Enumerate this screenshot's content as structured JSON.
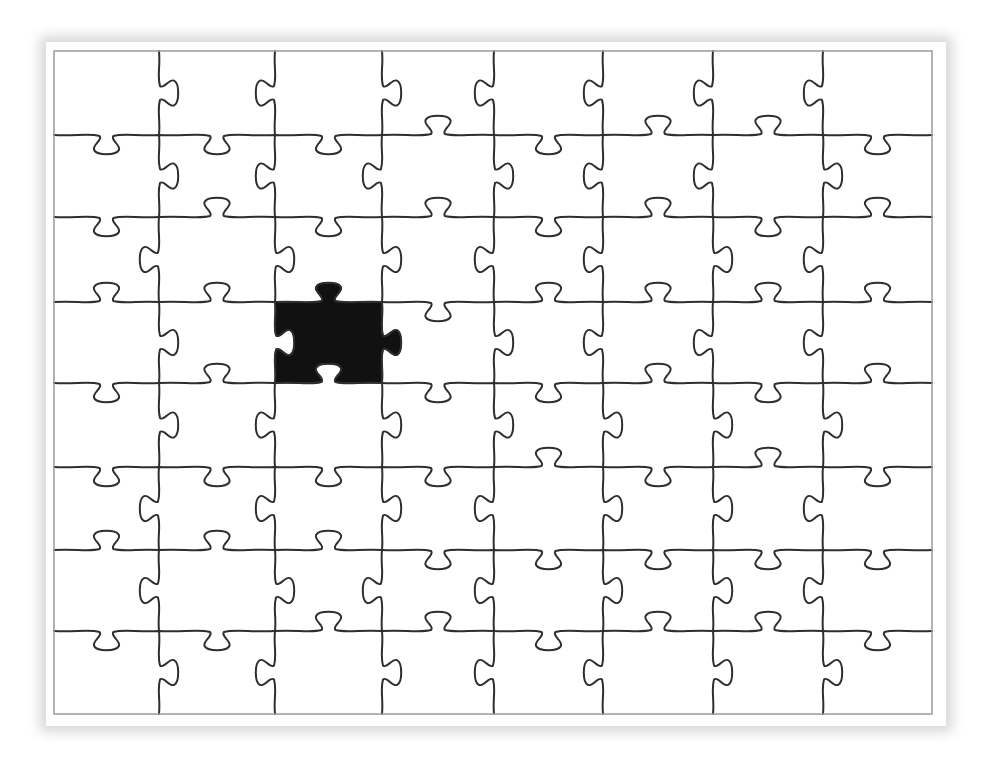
{
  "puzzle": {
    "title": "Jigsaw puzzle with one black piece",
    "frame": {
      "x0": 54,
      "y0": 51,
      "x1": 932,
      "y1": 714
    },
    "columns_x": [
      54,
      159,
      275,
      382,
      494,
      603,
      713,
      823,
      932
    ],
    "rows_y": [
      51,
      135,
      217,
      302,
      383,
      467,
      550,
      631,
      714
    ],
    "grid": {
      "cols": 8,
      "rows": 8
    },
    "colors": {
      "background": "#ffffff",
      "line": "#2e2e2e",
      "border": "#9a9a9a",
      "highlight_piece": "#111111"
    },
    "horizontal_edges": [
      [
        "down",
        "down",
        "down",
        "up",
        "down",
        "up",
        "up",
        "down"
      ],
      [
        "down",
        "up",
        "down",
        "up",
        "down",
        "up",
        "down",
        "up"
      ],
      [
        "up",
        "up",
        "up",
        "down",
        "up",
        "up",
        "up",
        "up"
      ],
      [
        "down",
        "up",
        "up",
        "down",
        "down",
        "up",
        "down",
        "up"
      ],
      [
        "down",
        "down",
        "down",
        "down",
        "up",
        "down",
        "up",
        "down"
      ],
      [
        "up",
        "up",
        "up",
        "down",
        "down",
        "down",
        "down",
        "down"
      ],
      [
        "down",
        "down",
        "up",
        "up",
        "down",
        "up",
        "up",
        "down"
      ]
    ],
    "vertical_edges": [
      [
        "right",
        "left",
        "right",
        "left",
        "left",
        "left",
        "left"
      ],
      [
        "right",
        "left",
        "left",
        "right",
        "left",
        "left",
        "right"
      ],
      [
        "left",
        "right",
        "right",
        "left",
        "left",
        "right",
        "left"
      ],
      [
        "right",
        "right",
        "right",
        "right",
        "left",
        "left",
        "left"
      ],
      [
        "right",
        "left",
        "right",
        "right",
        "right",
        "right",
        "right"
      ],
      [
        "left",
        "left",
        "right",
        "left",
        "right",
        "right",
        "left"
      ],
      [
        "left",
        "right",
        "left",
        "left",
        "right",
        "right",
        "left"
      ],
      [
        "right",
        "left",
        "right",
        "left",
        "left",
        "right",
        "right"
      ]
    ],
    "highlighted_piece": {
      "col": 2,
      "row": 3,
      "label": "missing-piece"
    }
  }
}
